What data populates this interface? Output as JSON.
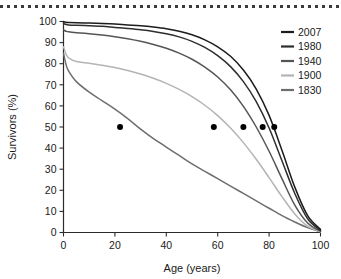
{
  "figure": {
    "top_rule": "dotted-rule"
  },
  "chart_data": {
    "type": "line",
    "title": "",
    "xlabel": "Age (years)",
    "ylabel": "Survivors (%)",
    "xlim": [
      0,
      100
    ],
    "ylim": [
      0,
      100
    ],
    "xticks": [
      0,
      20,
      40,
      60,
      80,
      100
    ],
    "yticks": [
      0,
      10,
      20,
      30,
      40,
      50,
      60,
      70,
      80,
      90,
      100
    ],
    "grid": false,
    "legend_position": "right",
    "x": [
      0,
      1,
      2,
      5,
      10,
      15,
      20,
      25,
      30,
      35,
      40,
      45,
      50,
      55,
      60,
      65,
      70,
      75,
      80,
      85,
      90,
      95,
      100
    ],
    "series": [
      {
        "name": "2007",
        "color": "#1c1c1c",
        "median_age": 82,
        "values": [
          100,
          99.6,
          99.5,
          99.4,
          99.3,
          99.1,
          98.8,
          98.4,
          98.0,
          97.4,
          96.6,
          95.4,
          93.7,
          91.3,
          88.0,
          83.5,
          77.0,
          68.0,
          55.5,
          39.0,
          21.5,
          8.0,
          1.5
        ]
      },
      {
        "name": "1980",
        "color": "#2e2e2e",
        "median_age": 77.5,
        "values": [
          99.0,
          98.6,
          98.4,
          98.2,
          98.0,
          97.7,
          97.2,
          96.7,
          96.1,
          95.3,
          94.2,
          92.7,
          90.6,
          87.7,
          83.8,
          78.6,
          71.5,
          62.0,
          49.5,
          34.0,
          18.5,
          6.5,
          1.0
        ]
      },
      {
        "name": "1940",
        "color": "#555555",
        "median_age": 70,
        "values": [
          96.0,
          95.4,
          95.1,
          94.7,
          94.2,
          93.6,
          92.8,
          91.8,
          90.6,
          89.1,
          87.3,
          85.0,
          82.1,
          78.4,
          73.7,
          67.6,
          59.8,
          50.0,
          38.5,
          25.5,
          13.0,
          4.5,
          0.6
        ]
      },
      {
        "name": "1900",
        "color": "#b4b4b4",
        "median_age": 58.5,
        "values": [
          88.0,
          84.5,
          82.8,
          81.0,
          80.2,
          79.3,
          78.2,
          76.8,
          75.1,
          73.1,
          70.7,
          67.8,
          64.4,
          60.3,
          55.4,
          49.5,
          42.6,
          34.7,
          26.0,
          17.0,
          8.8,
          3.0,
          0.4
        ]
      },
      {
        "name": "1830",
        "color": "#6e6e6e",
        "median_age": 22,
        "values": [
          85.0,
          79.5,
          76.5,
          71.5,
          66.5,
          62.5,
          58.5,
          54.0,
          49.0,
          44.5,
          40.5,
          36.5,
          32.5,
          29.0,
          25.5,
          22.0,
          18.5,
          15.0,
          11.5,
          8.0,
          5.0,
          2.3,
          0.3
        ]
      }
    ]
  },
  "axis": {
    "x_title": "Age (years)",
    "y_title": "Survivors (%)",
    "x_tick_labels": [
      "0",
      "20",
      "40",
      "60",
      "80",
      "100"
    ],
    "y_tick_labels": [
      "0",
      "10",
      "20",
      "30",
      "40",
      "50",
      "60",
      "70",
      "80",
      "90",
      "100"
    ]
  },
  "legend": {
    "entries": [
      {
        "label": "2007",
        "color": "#1c1c1c"
      },
      {
        "label": "1980",
        "color": "#2e2e2e"
      },
      {
        "label": "1940",
        "color": "#555555"
      },
      {
        "label": "1900",
        "color": "#b4b4b4"
      },
      {
        "label": "1830",
        "color": "#6e6e6e"
      }
    ]
  }
}
